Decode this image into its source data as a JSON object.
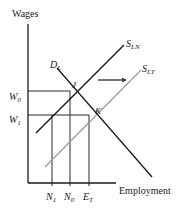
{
  "figure": {
    "type": "economics-line-diagram",
    "background": "#ffffff",
    "axes": {
      "y_title": "Wages",
      "x_title": "Employment",
      "y_axis_x_px": 28,
      "y_axis_top_px": 24,
      "x_axis_y_px": 183,
      "x_axis_right_px": 116
    },
    "y_ticks": [
      {
        "label": "W",
        "subscript": "0",
        "y_px": 93
      },
      {
        "label": "W",
        "subscript": "1",
        "y_px": 116
      }
    ],
    "x_ticks": [
      {
        "label": "N",
        "subscript": "1",
        "x_px": 52
      },
      {
        "label": "N",
        "subscript": "0",
        "x_px": 70
      },
      {
        "label": "E",
        "subscript": "T",
        "x_px": 89
      }
    ],
    "curves": [
      {
        "name": "labour-demand",
        "label": "D",
        "sublabel": "L",
        "color": "#1a1a1a",
        "width": 1.2,
        "from": {
          "x": 57,
          "y": 68
        },
        "to": {
          "x": 152,
          "y": 177
        },
        "label_pos": {
          "x": 50,
          "y": 55
        }
      },
      {
        "name": "labour-supply-normal",
        "label": "S",
        "sublabel": "LN",
        "color": "#1a1a1a",
        "width": 1.4,
        "from": {
          "x": 36,
          "y": 133
        },
        "to": {
          "x": 124,
          "y": 45
        },
        "label_pos": {
          "x": 126,
          "y": 34
        }
      },
      {
        "name": "labour-supply-temporary",
        "label": "S",
        "sublabel": "LT",
        "color": "#9a9a9a",
        "width": 1.2,
        "from": {
          "x": 45,
          "y": 167
        },
        "to": {
          "x": 141,
          "y": 70
        },
        "label_pos": {
          "x": 142,
          "y": 59
        }
      }
    ],
    "points": [
      {
        "name": "J",
        "label": "J",
        "x_px": 70,
        "y_px": 91,
        "label_x": 72,
        "label_y": 82
      },
      {
        "name": "K",
        "label": "K",
        "x_px": 89,
        "y_px": 115,
        "label_x": 95,
        "label_y": 108
      }
    ],
    "guide_lines": [
      {
        "name": "w0-to-J",
        "orientation": "horizontal",
        "y_px": 91,
        "x1_px": 28,
        "x2_px": 70
      },
      {
        "name": "w1-to-K",
        "orientation": "horizontal",
        "y_px": 115,
        "x1_px": 28,
        "x2_px": 89
      },
      {
        "name": "N1-vertical",
        "orientation": "vertical",
        "x_px": 52,
        "y1_px": 115,
        "y2_px": 183
      },
      {
        "name": "N0-vertical",
        "orientation": "vertical",
        "x_px": 70,
        "y1_px": 91,
        "y2_px": 183
      },
      {
        "name": "ET-vertical",
        "orientation": "vertical",
        "x_px": 89,
        "y1_px": 115,
        "y2_px": 183
      }
    ],
    "shift_arrow": {
      "name": "supply-shift-arrow",
      "x1_px": 98,
      "x2_px": 127,
      "y_px": 80,
      "direction": "right",
      "color": "#3a3a3a"
    },
    "colors": {
      "ink": "#1a1a1a",
      "gray_curve": "#9a9a9a",
      "guide": "#2b2b2b"
    }
  }
}
